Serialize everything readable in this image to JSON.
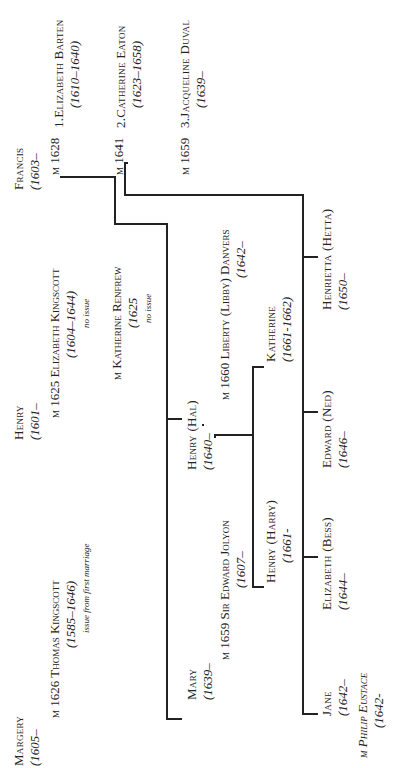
{
  "generation1": {
    "margery": {
      "name": "Margery",
      "dates": "(1605–",
      "marriage": "m 1626 Thomas Kingscott",
      "spouse_dates": "(1585–1646)",
      "note": "issue from first marriage"
    },
    "henry": {
      "name": "Henry",
      "dates": "(1601–",
      "marriage1": "m 1625 Elizabeth Kingscott",
      "marriage1_dates": "(1604–1644)",
      "marriage1_note": "no issue",
      "marriage2": "m Katherine Renfrew",
      "marriage2_dates": "(1625",
      "marriage2_note": "no issue"
    },
    "francis": {
      "name": "Francis",
      "dates": "(1603–",
      "marriages": [
        {
          "label": "m 1628",
          "spouse": "1.Elizabeth Barten",
          "dates": "(1610–1640)"
        },
        {
          "label": "m 1641",
          "spouse": "2.Catherine Eaton",
          "dates": "(1623–1658)"
        },
        {
          "label": "m 1659",
          "spouse": "3.Jacqueline Duval",
          "dates": "(1639–"
        }
      ]
    }
  },
  "generation2": {
    "mary": {
      "name": "Mary",
      "dates": "(1639–",
      "marriage": "m 1659 Sir Edward Jolyon",
      "spouse_dates": "(1607–"
    },
    "hal": {
      "name": "Henry (Hal)",
      "dates": "(1640–",
      "marriage": "m 1660 Liberty (Libby) Danvers",
      "spouse_dates": "(1642–"
    }
  },
  "generation3_hal": [
    {
      "name": "Henry (Harry)",
      "dates": "(1661-"
    },
    {
      "name": "Katherine",
      "dates": "(1661-1662)"
    }
  ],
  "generation2_francis": [
    {
      "name": "Jane",
      "dates": "(1642–",
      "marriage": "m Philip Eustace",
      "spouse_dates": "(1642-"
    },
    {
      "name": "Elizabeth (Bess)",
      "dates": "(1644–"
    },
    {
      "name": "Edward (Ned)",
      "dates": "(1646–"
    },
    {
      "name": "Henrietta (Hetta)",
      "dates": "(1650–"
    }
  ]
}
